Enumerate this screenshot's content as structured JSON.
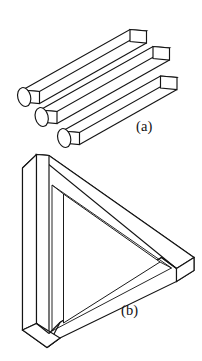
{
  "figure": {
    "background_color": "#ffffff",
    "ink_color": "#141414",
    "panels": [
      {
        "id": "a",
        "caption": "(a)",
        "name": "three-rods-impossible-trident",
        "description": "Three parallel rods drawn in oblique projection; near ends are rounded cylindrical ellipses while far ends are flat rectangular faces",
        "rod_count": 3,
        "near_end_shape": "ellipse",
        "far_end_shape": "parallelogram"
      },
      {
        "id": "b",
        "caption": "(b)",
        "name": "penrose-impossible-triangle",
        "description": "Penrose tribar: three square beams joined at right angles forming an impossible closed triangle",
        "beam_count": 3,
        "orientation": "apex-right"
      }
    ]
  },
  "captions": {
    "panel_a": "(a)",
    "panel_b": "(b)"
  }
}
